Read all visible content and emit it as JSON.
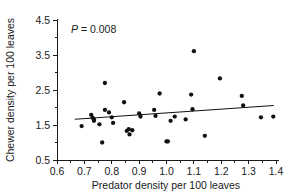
{
  "chart_data": {
    "type": "scatter",
    "title": "",
    "subtitle": "",
    "xlabel": "Predator density per 100 leaves",
    "ylabel": "Chewer density per 100 leaves",
    "xlim": [
      0.6,
      1.4
    ],
    "ylim": [
      0.5,
      4.5
    ],
    "xticks": [
      0.6,
      0.7,
      0.8,
      0.9,
      1.0,
      1.1,
      1.2,
      1.3,
      1.4
    ],
    "xtick_labels": [
      "0.6",
      "0.7",
      "0.8",
      "0.9",
      "1.0",
      "1.1",
      "1.2",
      "1.3",
      "1.4"
    ],
    "yticks": [
      0.5,
      1.5,
      2.5,
      3.5,
      4.5
    ],
    "ytick_labels": [
      "0.5",
      "1.5",
      "2.5",
      "3.5",
      "4.5"
    ],
    "minor_xticks": [
      0.65,
      0.75,
      0.85,
      0.95,
      1.05,
      1.15,
      1.25,
      1.35
    ],
    "minor_yticks": [
      1.0,
      2.0,
      3.0,
      4.0
    ],
    "grid": false,
    "legend": null,
    "marker": "filled-circle",
    "marker_color": "#111111",
    "annotations": [
      {
        "name": "p-value",
        "text_italic": "P",
        "text": " = 0.008",
        "full_text": "P = 0.008",
        "x": 0.72,
        "y": 4.02
      }
    ],
    "points": [
      {
        "x": 0.69,
        "y": 1.47
      },
      {
        "x": 0.725,
        "y": 1.79
      },
      {
        "x": 0.73,
        "y": 1.71
      },
      {
        "x": 0.735,
        "y": 1.62
      },
      {
        "x": 0.735,
        "y": 1.66
      },
      {
        "x": 0.755,
        "y": 1.52
      },
      {
        "x": 0.765,
        "y": 1.0
      },
      {
        "x": 0.775,
        "y": 2.7
      },
      {
        "x": 0.775,
        "y": 1.93
      },
      {
        "x": 0.79,
        "y": 1.86
      },
      {
        "x": 0.8,
        "y": 1.72
      },
      {
        "x": 0.805,
        "y": 1.56
      },
      {
        "x": 0.845,
        "y": 2.15
      },
      {
        "x": 0.855,
        "y": 1.33
      },
      {
        "x": 0.862,
        "y": 1.38
      },
      {
        "x": 0.865,
        "y": 1.23
      },
      {
        "x": 0.875,
        "y": 1.35
      },
      {
        "x": 0.9,
        "y": 1.83
      },
      {
        "x": 0.905,
        "y": 1.74
      },
      {
        "x": 0.955,
        "y": 1.93
      },
      {
        "x": 0.96,
        "y": 1.76
      },
      {
        "x": 0.975,
        "y": 2.4
      },
      {
        "x": 1.0,
        "y": 1.03
      },
      {
        "x": 1.005,
        "y": 1.03
      },
      {
        "x": 1.015,
        "y": 1.62
      },
      {
        "x": 1.03,
        "y": 1.74
      },
      {
        "x": 1.07,
        "y": 1.66
      },
      {
        "x": 1.09,
        "y": 2.37
      },
      {
        "x": 1.095,
        "y": 1.95
      },
      {
        "x": 1.1,
        "y": 3.61
      },
      {
        "x": 1.14,
        "y": 1.19
      },
      {
        "x": 1.195,
        "y": 2.83
      },
      {
        "x": 1.275,
        "y": 2.33
      },
      {
        "x": 1.28,
        "y": 2.06
      },
      {
        "x": 1.345,
        "y": 1.72
      },
      {
        "x": 1.39,
        "y": 1.74
      }
    ],
    "fit_line": {
      "name": "linear-regression",
      "x_start": 0.665,
      "y_start": 1.665,
      "x_end": 1.392,
      "y_end": 2.055
    }
  }
}
